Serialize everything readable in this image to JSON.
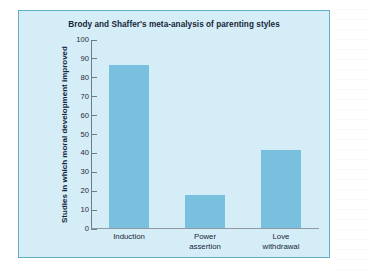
{
  "panel": {
    "background_color": "#d5edf6",
    "border_color": "#63aec7"
  },
  "chart_data": {
    "type": "bar",
    "title": "Brody and Shaffer's meta-analysis of parenting styles",
    "xlabel": "",
    "ylabel": "Studies in which moral development improved",
    "categories": [
      "Induction",
      "Power assertion",
      "Love withdrawal"
    ],
    "category_lines": [
      [
        "Induction"
      ],
      [
        "Power",
        "assertion"
      ],
      [
        "Love",
        "withdrawal"
      ]
    ],
    "values": [
      86,
      17.5,
      41.5
    ],
    "ylim": [
      0,
      100
    ],
    "yticks": [
      0,
      10,
      20,
      30,
      40,
      50,
      60,
      70,
      80,
      90,
      100
    ],
    "ytick_labels": [
      "0",
      "10",
      "20",
      "30",
      "40",
      "50",
      "60",
      "70",
      "80",
      "90",
      "100"
    ],
    "grid": false,
    "legend": false,
    "bar_color": "#79c0df",
    "axis_color": "#6f7b85"
  }
}
